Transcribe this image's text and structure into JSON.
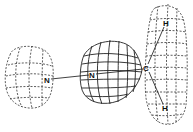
{
  "diagram": {
    "type": "molecular-orbital-surface",
    "colors": {
      "background": "#ffffff",
      "line": "#222222"
    },
    "atoms": [
      {
        "id": "n1",
        "label": "N",
        "x": 47,
        "y": 80
      },
      {
        "id": "n2",
        "label": "N",
        "x": 92,
        "y": 75
      },
      {
        "id": "c",
        "label": "C",
        "x": 146,
        "y": 68
      },
      {
        "id": "h1",
        "label": "H",
        "x": 166,
        "y": 23
      },
      {
        "id": "h2",
        "label": "H",
        "x": 165,
        "y": 108
      }
    ],
    "bonds": [
      {
        "from": "n1",
        "to": "n2"
      },
      {
        "from": "n2",
        "to": "c"
      },
      {
        "from": "c",
        "to": "h1"
      },
      {
        "from": "c",
        "to": "h2"
      }
    ],
    "lobes": [
      {
        "id": "left-lobe",
        "style": "dashed",
        "around": "n1"
      },
      {
        "id": "center-lobe",
        "style": "solid",
        "around": "n2"
      },
      {
        "id": "right-lobe",
        "style": "dashed",
        "around": "c-h2"
      }
    ]
  }
}
